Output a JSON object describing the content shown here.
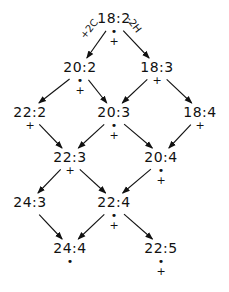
{
  "diagram": {
    "type": "lattice",
    "nodes": [
      {
        "id": "n18_2",
        "label": "18:2",
        "x": 114,
        "y": 18,
        "markers": [
          "•",
          "+"
        ]
      },
      {
        "id": "n20_2",
        "label": "20:2",
        "x": 80,
        "y": 67,
        "markers": [
          "•",
          "+"
        ]
      },
      {
        "id": "n18_3",
        "label": "18:3",
        "x": 157,
        "y": 67,
        "markers": [
          "+"
        ]
      },
      {
        "id": "n22_2",
        "label": "22:2",
        "x": 30,
        "y": 112,
        "markers": [
          "+"
        ]
      },
      {
        "id": "n20_3",
        "label": "20:3",
        "x": 114,
        "y": 112,
        "markers": [
          "•",
          "+"
        ]
      },
      {
        "id": "n18_4",
        "label": "18:4",
        "x": 200,
        "y": 112,
        "markers": [
          "+"
        ]
      },
      {
        "id": "n22_3",
        "label": "22:3",
        "x": 70,
        "y": 157,
        "markers": [
          "+"
        ]
      },
      {
        "id": "n20_4",
        "label": "20:4",
        "x": 161,
        "y": 157,
        "markers": [
          "•",
          "+"
        ]
      },
      {
        "id": "n24_3",
        "label": "24:3",
        "x": 30,
        "y": 202,
        "markers": []
      },
      {
        "id": "n22_4",
        "label": "22:4",
        "x": 114,
        "y": 202,
        "markers": [
          "•",
          "+"
        ]
      },
      {
        "id": "n24_4",
        "label": "24:4",
        "x": 70,
        "y": 248,
        "markers": [
          "•"
        ]
      },
      {
        "id": "n22_5",
        "label": "22:5",
        "x": 161,
        "y": 248,
        "markers": [
          "•",
          "+"
        ]
      }
    ],
    "edges": [
      {
        "from": "n18_2",
        "to": "n20_2",
        "label": "+2C"
      },
      {
        "from": "n18_2",
        "to": "n18_3",
        "label": "-2H"
      },
      {
        "from": "n20_2",
        "to": "n22_2"
      },
      {
        "from": "n20_2",
        "to": "n20_3"
      },
      {
        "from": "n18_3",
        "to": "n20_3"
      },
      {
        "from": "n18_3",
        "to": "n18_4"
      },
      {
        "from": "n22_2",
        "to": "n22_3"
      },
      {
        "from": "n20_3",
        "to": "n22_3"
      },
      {
        "from": "n20_3",
        "to": "n20_4"
      },
      {
        "from": "n18_4",
        "to": "n20_4"
      },
      {
        "from": "n22_3",
        "to": "n24_3"
      },
      {
        "from": "n22_3",
        "to": "n22_4"
      },
      {
        "from": "n20_4",
        "to": "n22_4"
      },
      {
        "from": "n24_3",
        "to": "n24_4"
      },
      {
        "from": "n22_4",
        "to": "n24_4"
      },
      {
        "from": "n22_4",
        "to": "n22_5"
      }
    ],
    "edge_labels": {
      "elongation": "+2C",
      "desaturation": "-2H"
    }
  }
}
